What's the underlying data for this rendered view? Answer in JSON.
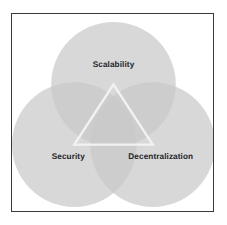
{
  "diagram": {
    "frame": {
      "border_color": "#3a3a3c",
      "background_color": "#ffffff"
    },
    "circle_fill": "#c9c9c9",
    "circle_fill_opacity": 0.72,
    "overlap_color": "#a8a8a8",
    "triangle_stroke": "#f2f2f2",
    "label_color": "#242428",
    "sets": [
      {
        "id": "scalability",
        "label": "Scalability",
        "cx": 101,
        "cy": 70,
        "r": 62,
        "label_x": 101,
        "label_y": 51
      },
      {
        "id": "security",
        "label": "Security",
        "cx": 62,
        "cy": 130,
        "r": 62,
        "label_x": 56,
        "label_y": 142
      },
      {
        "id": "decentralization",
        "label": "Decentralization",
        "cx": 140,
        "cy": 130,
        "r": 62,
        "label_x": 148,
        "label_y": 142
      }
    ],
    "triangle": {
      "points": "101,70 62,130 140,130",
      "stroke_width": 2.4
    }
  }
}
